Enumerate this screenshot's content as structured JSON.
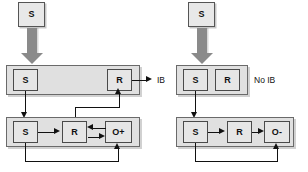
{
  "figure": {
    "type": "block-diagram",
    "background_color": "#ffffff",
    "node_fill": "#e8e8e8",
    "band_fill": "#e0e0e0",
    "stroke_color": "#111111",
    "fat_arrow_color": "#8a8a8a"
  },
  "panels": [
    {
      "id": "left",
      "condition_label": "IB",
      "input": {
        "label": "S"
      },
      "middle_band": {
        "nodes": [
          {
            "label": "S"
          },
          {
            "label": "R"
          }
        ],
        "output_label": "IB"
      },
      "bottom_band": {
        "nodes": [
          {
            "label": "S"
          },
          {
            "label": "R"
          },
          {
            "label": "O+"
          }
        ]
      }
    },
    {
      "id": "right",
      "condition_label": "No IB",
      "input": {
        "label": "S"
      },
      "middle_band": {
        "nodes": [
          {
            "label": "S"
          },
          {
            "label": "R"
          }
        ],
        "output_label": "No IB"
      },
      "bottom_band": {
        "nodes": [
          {
            "label": "S"
          },
          {
            "label": "R"
          },
          {
            "label": "O-"
          }
        ]
      }
    }
  ]
}
